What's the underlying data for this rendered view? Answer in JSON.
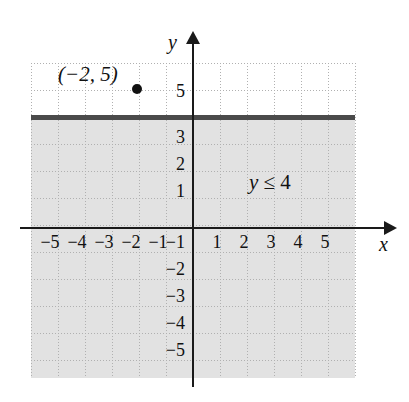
{
  "figure": {
    "type": "coordinate-plane-inequality-graph",
    "background_color": "#ffffff"
  },
  "chart_data": {
    "type": "scatter",
    "title": "",
    "xlabel": "x",
    "ylabel": "y",
    "xlim": [
      -6,
      6
    ],
    "ylim": [
      -6,
      6
    ],
    "grid": true,
    "legend": null,
    "x_ticks": [
      "-5",
      "-4",
      "-3",
      "-2",
      "-1",
      "1",
      "2",
      "3",
      "4",
      "5"
    ],
    "x_tick_values": [
      -5,
      -4,
      -3,
      -2,
      -1,
      1,
      2,
      3,
      4,
      5
    ],
    "y_ticks": [
      "5",
      "3",
      "2",
      "1",
      "-1",
      "-2",
      "-3",
      "-4",
      "-5"
    ],
    "y_tick_values": [
      5,
      3,
      2,
      1,
      -1,
      -2,
      -3,
      -4,
      -5
    ],
    "points": [
      {
        "label": "(−2, 5)",
        "x": -2,
        "y": 5,
        "style": "filled-circle"
      }
    ],
    "inequality": {
      "expression": "y ≤ 4",
      "boundary_value": 4,
      "boundary_style": "solid",
      "shaded_side": "below",
      "shading_color": "#e2e2e2",
      "boundary_color": "#4a4a4a"
    },
    "annotations": [
      {
        "text": "y ≤ 4",
        "x": 2.1,
        "y": 1.6
      },
      {
        "text": "(−2, 5)",
        "x": -4.2,
        "y": 5.6
      }
    ]
  },
  "axes": {
    "y_label": "y",
    "x_label": "x",
    "x_tick_labels": [
      {
        "text": "−5",
        "left": 37
      },
      {
        "text": "−4",
        "left": 64
      },
      {
        "text": "−3",
        "left": 91
      },
      {
        "text": "−2",
        "left": 118
      },
      {
        "text": "−1",
        "left": 145
      },
      {
        "text": "1",
        "left": 204
      },
      {
        "text": "2",
        "left": 231
      },
      {
        "text": "3",
        "left": 258
      },
      {
        "text": "4",
        "left": 285
      },
      {
        "text": "5",
        "left": 312
      }
    ],
    "y_tick_labels": [
      {
        "text": "5",
        "top": 81
      },
      {
        "text": "3",
        "top": 127
      },
      {
        "text": "2",
        "top": 154
      },
      {
        "text": "1",
        "top": 181
      },
      {
        "text": "−1",
        "top": 232
      },
      {
        "text": "−2",
        "top": 259
      },
      {
        "text": "−3",
        "top": 286
      },
      {
        "text": "−4",
        "top": 313
      },
      {
        "text": "−5",
        "top": 340
      }
    ]
  },
  "point_annotation": {
    "text": "(−2, 5)"
  },
  "inequality_annotation": {
    "lhs": "y",
    "relation": " ≤ ",
    "rhs": "4",
    "full": "y ≤ 4"
  }
}
